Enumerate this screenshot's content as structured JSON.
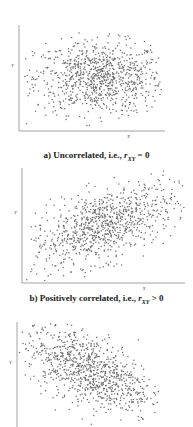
{
  "chart_data": [
    {
      "type": "scatter",
      "title": "a) Uncorrelated, i.e., r_XY = 0",
      "xlabel": "X",
      "ylabel": "Y",
      "correlation": 0,
      "n_points_approx": 900,
      "center": [
        0.55,
        0.5
      ],
      "spread": [
        0.22,
        0.17
      ],
      "grid": false,
      "plot_box": {
        "x0": 19,
        "y0": 25,
        "x1": 165,
        "y1": 131
      }
    },
    {
      "type": "scatter",
      "title": "b) Positively correlated, i.e., r_XY > 0",
      "xlabel": "X",
      "ylabel": "Y",
      "correlation": 0.55,
      "n_points_approx": 900,
      "center": [
        0.5,
        0.5
      ],
      "spread": [
        0.22,
        0.18
      ],
      "grid": false,
      "plot_box": {
        "x0": 22,
        "y0": 168,
        "x1": 185,
        "y1": 283
      }
    },
    {
      "type": "scatter",
      "title": "",
      "xlabel": "",
      "ylabel": "Y",
      "correlation": -0.55,
      "n_points_approx": 900,
      "center": [
        0.5,
        0.55
      ],
      "spread": [
        0.22,
        0.2
      ],
      "grid": false,
      "plot_box": {
        "x0": 17,
        "y0": 322,
        "x1": 160,
        "y1": 427
      }
    }
  ],
  "captions": {
    "a": {
      "prefix": "a) Uncorrelated, i.e., ",
      "var": "r",
      "sub": "XY",
      "suffix": " = 0"
    },
    "b": {
      "prefix": "b) Positively correlated, i.e., ",
      "var": "r",
      "sub": "XY",
      "suffix": " > 0"
    }
  },
  "axis_labels": {
    "x": "X",
    "y": "Y"
  },
  "colors": {
    "dots": "#6e6e6e",
    "axis": "#8a8a8a",
    "text": "#1a1a1a"
  }
}
